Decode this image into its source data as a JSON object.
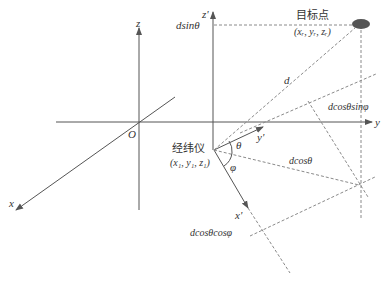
{
  "diagram": {
    "colors": {
      "axis": "#555555",
      "dashed": "#8a8a8a",
      "text": "#333333",
      "target": "#555555",
      "background": "#ffffff"
    },
    "global_axes": {
      "origin_label": "O",
      "x_label": "x",
      "y_label": "y",
      "z_label": "z"
    },
    "local_axes": {
      "x_label": "x'",
      "y_label": "y'",
      "z_label": "z'"
    },
    "theodolite": {
      "name": "经纬仪",
      "coords": "(x",
      "coords_full": "(x₁, y₁, z₁)"
    },
    "target": {
      "name": "目标点",
      "coords_full": "(xᵣ, yᵣ, zᵣ)"
    },
    "angles": {
      "theta": "θ",
      "phi": "φ"
    },
    "segment_labels": {
      "d": "d",
      "d_sin_theta": "dsinθ",
      "d_cos_theta": "dcosθ",
      "d_cos_theta_sin_phi": "dcosθsinφ",
      "d_cos_theta_cos_phi": "dcosθcosφ"
    }
  }
}
